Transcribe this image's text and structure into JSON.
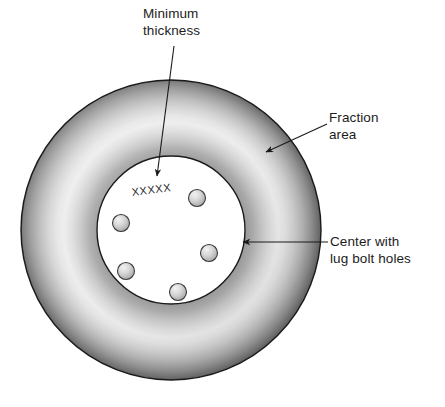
{
  "figure": {
    "background_color": "#ffffff"
  },
  "annotations": [
    {
      "id": "minimum-thickness",
      "text": "Minimum\nthickness",
      "arrow": "vertical-down-arrow"
    },
    {
      "id": "fraction-area",
      "text": "Fraction\narea",
      "arrow": "diagonal-down-left-arrow"
    },
    {
      "id": "center-lug-bolt-holes",
      "text": "Center with\nlug bolt holes",
      "arrow": "horizontal-left-arrow"
    }
  ],
  "rotor": {
    "hub_marking_text": "XXXXX",
    "outer_edge_color": "#5a5a5a",
    "highlight_color": "#ededed",
    "inner_shadow_color": "#8e8e8e",
    "hub_fill_color": "#ffffff",
    "outline_color": "#1a1a1a",
    "lug_bolt_hole_count": 5,
    "lug_bolt_hole_color": "#b9b9b9",
    "lug_bolt_holes": [
      {
        "name": "lug-bolt-hole-top-right",
        "cx": 197,
        "cy": 198,
        "r": 8.5
      },
      {
        "name": "lug-bolt-hole-left",
        "cx": 121,
        "cy": 223,
        "r": 8.5
      },
      {
        "name": "lug-bolt-hole-right",
        "cx": 209,
        "cy": 253,
        "r": 8.5
      },
      {
        "name": "lug-bolt-hole-lower-left",
        "cx": 126,
        "cy": 271,
        "r": 8.5
      },
      {
        "name": "lug-bolt-hole-bottom",
        "cx": 178,
        "cy": 292,
        "r": 8.5
      }
    ],
    "outer_circle": {
      "cx": 171,
      "cy": 230,
      "r": 150
    },
    "inner_circle": {
      "cx": 171,
      "cy": 230,
      "r": 74
    }
  }
}
